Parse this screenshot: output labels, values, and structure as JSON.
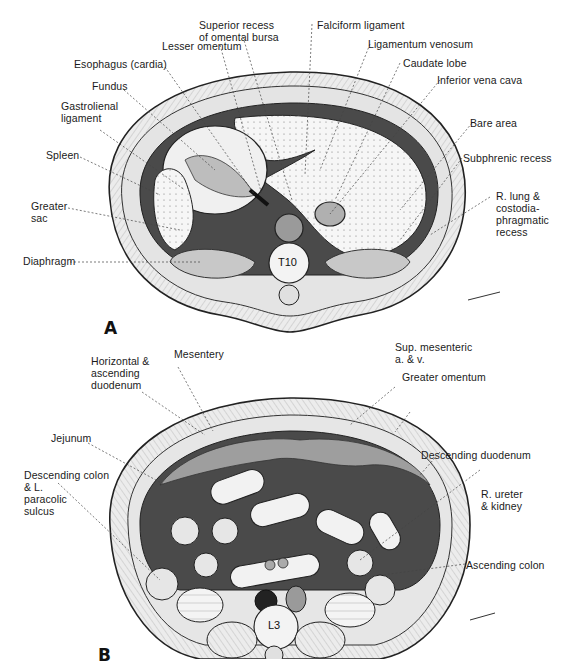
{
  "figure_a": {
    "panel_letter": "A",
    "vertebra": "T10",
    "labels": {
      "superior_recess": "Superior recess\nof omental bursa",
      "lesser_omentum": "Lesser omentum",
      "esophagus": "Esophagus (cardia)",
      "fundus": "Fundus",
      "gastrolienal": "Gastrolienal\nligament",
      "spleen": "Spleen",
      "greater_sac": "Greater\nsac",
      "diaphragm": "Diaphragm",
      "falciform": "Falciform ligament",
      "ligamentum_venosum": "Ligamentum venosum",
      "caudate_lobe": "Caudate lobe",
      "ivc": "Inferior vena cava",
      "bare_area": "Bare area",
      "subphrenic": "Subphrenic recess",
      "r_lung": "R. lung &\ncostodia-\nphragmatic\nrecess"
    }
  },
  "figure_b": {
    "panel_letter": "B",
    "vertebra": "L3",
    "labels": {
      "horizontal_duodenum": "Horizontal &\nascending\nduodenum",
      "mesentery": "Mesentery",
      "jejunum": "Jejunum",
      "descending_colon": "Descending colon\n& L.\nparacolic\nsulcus",
      "sup_mesenteric": "Sup. mesenteric\na. & v.",
      "greater_omentum": "Greater omentum",
      "descending_duodenum": "Descending duodenum",
      "r_ureter": "R. ureter\n& kidney",
      "ascending_colon": "Ascending colon"
    }
  },
  "colors": {
    "peritoneal_dark": "#4a4a4a",
    "organ_light": "#f2f2f2",
    "wall_fill": "#e6e6e6",
    "mid_gray": "#9a9a9a",
    "line": "#222222"
  }
}
